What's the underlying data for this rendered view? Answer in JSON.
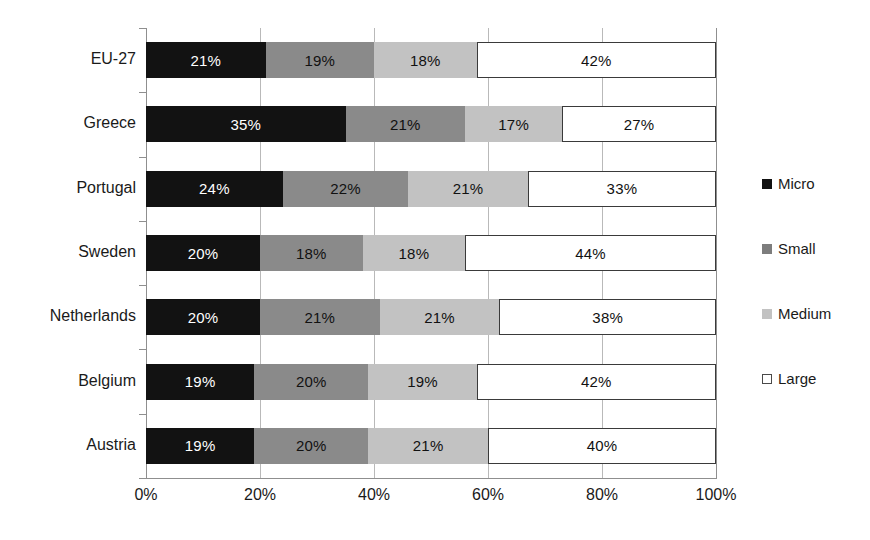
{
  "chart_data": {
    "type": "bar",
    "orientation": "horizontal",
    "stacked": true,
    "stack_mode": "percent",
    "title": "",
    "subtitle": "",
    "xlabel": "",
    "ylabel": "",
    "xlim": [
      0,
      100
    ],
    "grid": true,
    "legend_position": "right",
    "categories": [
      "EU-27",
      "Greece",
      "Portugal",
      "Sweden",
      "Netherlands",
      "Belgium",
      "Austria"
    ],
    "xticks": [
      0,
      20,
      40,
      60,
      80,
      100
    ],
    "xtick_labels": [
      "0%",
      "20%",
      "40%",
      "60%",
      "80%",
      "100%"
    ],
    "series": [
      {
        "name": "Micro",
        "color": "#121212",
        "values": [
          21,
          35,
          24,
          20,
          20,
          19,
          19
        ],
        "labels": [
          "21%",
          "35%",
          "24%",
          "20%",
          "20%",
          "19%",
          "19%"
        ]
      },
      {
        "name": "Small",
        "color": "#8a8a8a",
        "values": [
          19,
          21,
          22,
          18,
          21,
          20,
          20
        ],
        "labels": [
          "19%",
          "21%",
          "22%",
          "18%",
          "21%",
          "20%",
          "20%"
        ]
      },
      {
        "name": "Medium",
        "color": "#c2c2c2",
        "values": [
          18,
          17,
          21,
          18,
          21,
          19,
          21
        ],
        "labels": [
          "18%",
          "17%",
          "21%",
          "18%",
          "21%",
          "19%",
          "21%"
        ]
      },
      {
        "name": "Large",
        "color": "#ffffff",
        "values": [
          42,
          27,
          33,
          44,
          38,
          42,
          40
        ],
        "labels": [
          "42%",
          "27%",
          "33%",
          "44%",
          "38%",
          "42%",
          "40%"
        ]
      }
    ]
  },
  "legend": {
    "items": [
      {
        "label": "Micro",
        "swatch": "micro-swatch-icon"
      },
      {
        "label": "Small",
        "swatch": "small-swatch-icon"
      },
      {
        "label": "Medium",
        "swatch": "medium-swatch-icon"
      },
      {
        "label": "Large",
        "swatch": "large-swatch-icon"
      }
    ]
  },
  "colors": {
    "micro": "#121212",
    "small": "#8a8a8a",
    "medium": "#c2c2c2",
    "large": "#ffffff",
    "grid": "#b9b9b9",
    "axis": "#8f8f8f",
    "text": "#1a1a1a",
    "background": "#ffffff"
  }
}
